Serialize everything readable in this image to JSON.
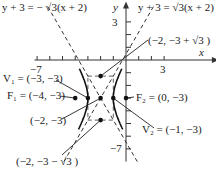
{
  "diagram": {
    "type": "hyperbola-graph",
    "equation_asymptote_left": "y + 3 = − √3(x + 2)",
    "equation_asymptote_right": "y + 3 = √3(x + 2)",
    "axis_x_label": "x",
    "axis_y_label": "y",
    "tick_labels": {
      "x_neg": "−7",
      "x_pos": "3",
      "y_pos": "3",
      "y_neg": "−7"
    },
    "center": {
      "x": -2,
      "y": -3
    },
    "a": 1,
    "b": 1.7320508,
    "points": {
      "v1": {
        "label": "V₁ = (−3, −3)",
        "x": -3,
        "y": -3
      },
      "f1": {
        "label": "F₁ = (−4, −3)",
        "x": -4,
        "y": -3
      },
      "center": {
        "label": "(−2, −3)",
        "x": -2,
        "y": -3
      },
      "top": {
        "label": "(−2, −3 + √3 )",
        "x": -2,
        "y": -1.2679
      },
      "bottom": {
        "label": "(−2, −3 − √3 )",
        "x": -2,
        "y": -4.7321
      },
      "f2": {
        "label": "F₂ = (0, −3)",
        "x": 0,
        "y": -3
      },
      "v2": {
        "label": "V₂ = (−1, −3)",
        "x": -1,
        "y": -3
      }
    }
  }
}
